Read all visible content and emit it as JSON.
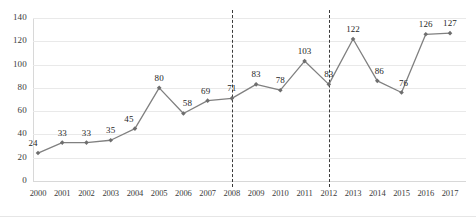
{
  "chart_data": {
    "type": "line",
    "title": "",
    "subtitle": "",
    "xlabel": "",
    "ylabel": "",
    "categories": [
      "2000",
      "2001",
      "2002",
      "2003",
      "2004",
      "2005",
      "2006",
      "2007",
      "2008",
      "2009",
      "2010",
      "2011",
      "2012",
      "2013",
      "2014",
      "2015",
      "2016",
      "2017"
    ],
    "values": [
      24,
      33,
      33,
      35,
      45,
      80,
      58,
      69,
      71,
      83,
      78,
      103,
      83,
      122,
      86,
      76,
      126,
      127
    ],
    "series": [
      {
        "name": "",
        "values": [
          24,
          33,
          33,
          35,
          45,
          80,
          58,
          69,
          71,
          83,
          78,
          103,
          83,
          122,
          86,
          76,
          126,
          127
        ]
      }
    ],
    "data_labels": [
      "24",
      "33",
      "33",
      "35",
      "45",
      "80",
      "58",
      "69",
      "71",
      "83",
      "78",
      "103",
      "83",
      "122",
      "86",
      "76",
      "126",
      "127"
    ],
    "ylim": [
      0,
      140
    ],
    "ytick_step": 20,
    "yticks": [
      "0",
      "20",
      "40",
      "60",
      "80",
      "100",
      "120",
      "140"
    ],
    "grid": "horizontal",
    "legend": "none",
    "marker": "diamond",
    "annotations": [
      {
        "type": "vertical-dashed-line",
        "at": "2008"
      },
      {
        "type": "vertical-dashed-line",
        "at": "2012"
      }
    ],
    "colors": {
      "line": "#808080",
      "marker": "#6e6e6e",
      "grid": "#e9e9e9",
      "axis": "#d8d8d8",
      "label_text": "#262626",
      "tick_text": "#3b3b3b",
      "reference_line": "#3a3a3a",
      "background": "#ffffff"
    }
  }
}
